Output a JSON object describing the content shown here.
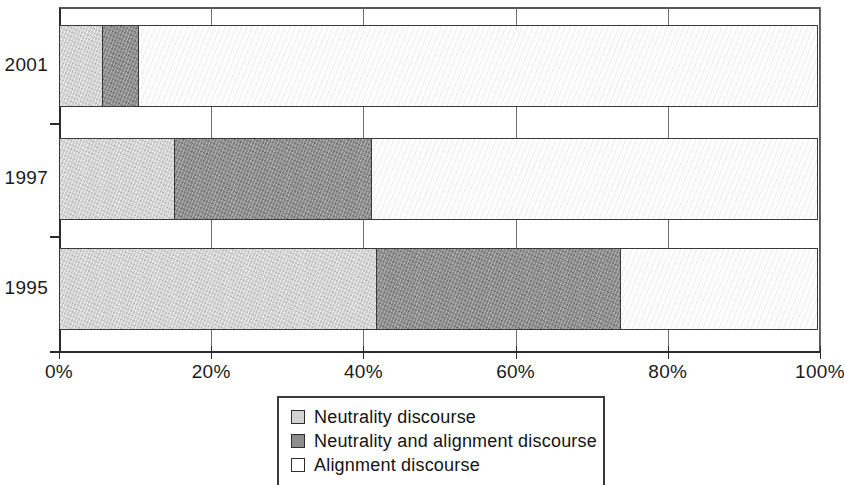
{
  "chart_data": {
    "type": "bar",
    "orientation": "horizontal",
    "stacked": true,
    "normalized": true,
    "title": "",
    "xlabel": "",
    "ylabel": "",
    "categories": [
      "2001",
      "1997",
      "1995"
    ],
    "xticks": [
      "0%",
      "20%",
      "40%",
      "60%",
      "80%",
      "100%"
    ],
    "xtick_values": [
      0,
      20,
      40,
      60,
      80,
      100
    ],
    "xlim": [
      0,
      100
    ],
    "grid": true,
    "legend_position": "bottom-center",
    "series": [
      {
        "name": "Neutrality discourse",
        "color": "#d2d2d2",
        "values": [
          5.8,
          15.2,
          41.8
        ]
      },
      {
        "name": "Neutrality and alignment discourse",
        "color": "#8d8d8d",
        "values": [
          4.8,
          26.1,
          32.2
        ]
      },
      {
        "name": "Alignment discourse",
        "color": "#ffffff",
        "values": [
          89.4,
          58.7,
          26.0
        ]
      }
    ]
  },
  "axis": {
    "x_tick_labels": [
      {
        "text": "0%",
        "value": 0
      },
      {
        "text": "20%",
        "value": 20
      },
      {
        "text": "40%",
        "value": 40
      },
      {
        "text": "60%",
        "value": 60
      },
      {
        "text": "80%",
        "value": 80
      },
      {
        "text": "100%",
        "value": 100
      }
    ],
    "y_tick_labels": [
      "2001",
      "1997",
      "1995"
    ]
  },
  "legend": {
    "items": [
      {
        "label": "Neutrality discourse",
        "swatch": "neutrality"
      },
      {
        "label": "Neutrality and alignment discourse",
        "swatch": "neutrality-alignment"
      },
      {
        "label": "Alignment discourse",
        "swatch": "alignment"
      }
    ]
  }
}
